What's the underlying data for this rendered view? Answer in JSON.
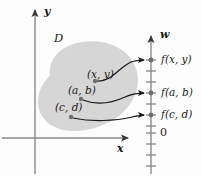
{
  "figure": {
    "domain_label": "D",
    "axes": {
      "x_label": "x",
      "y_label": "y",
      "w_label": "w",
      "origin_label": "0"
    },
    "colors": {
      "blob_fill": "#d6d6d6",
      "axis_stroke": "#8a8a8a",
      "arrow_stroke": "#1a1a1a",
      "dot_fill": "#6e6e6e",
      "text": "#1a1a1a",
      "background": "#fdfdfd"
    },
    "points": [
      {
        "id": "point-xy",
        "label": "(x, y)",
        "label_x": 87,
        "label_y": 74,
        "dot_x": 95,
        "dot_y": 81
      },
      {
        "id": "point-ab",
        "label": "(a, b)",
        "label_x": 68,
        "label_y": 90,
        "dot_x": 81,
        "dot_y": 99
      },
      {
        "id": "point-cd",
        "label": "(c, d)",
        "label_x": 55,
        "label_y": 107,
        "dot_x": 71,
        "dot_y": 117
      }
    ],
    "values": [
      {
        "id": "value-fxy",
        "label": "f(x, y)",
        "label_x": 162,
        "label_y": 55,
        "tick_y": 60
      },
      {
        "id": "value-fab",
        "label": "f(a, b)",
        "label_x": 162,
        "label_y": 88,
        "tick_y": 93
      },
      {
        "id": "value-fcd",
        "label": "f(c, d)",
        "label_x": 162,
        "label_y": 110,
        "tick_y": 115
      }
    ],
    "w_axis": {
      "x": 151,
      "top": 34,
      "bottom": 174,
      "zero_y": 133,
      "tick_half_width": 5,
      "ticks_y": [
        60,
        71,
        82,
        93,
        104,
        115,
        126,
        133,
        144,
        155,
        166
      ]
    },
    "xy_axes": {
      "y_axis_x": 35,
      "y_axis_top": 8,
      "y_axis_bottom": 174,
      "x_axis_y": 138,
      "x_axis_left": 2,
      "x_axis_right": 131,
      "x_label_x": 117,
      "x_label_y": 145,
      "y_label_x": 44,
      "y_label_y": 8,
      "w_label_x": 160,
      "w_label_y": 32,
      "zero_label_x": 159,
      "zero_label_y": 127
    },
    "blob": {
      "fill": "#d6d6d6",
      "path": "M 50 75 C 48 58, 62 45, 82 42 C 103 39, 124 46, 133 62 C 142 78, 138 95, 127 108 C 118 119, 103 127, 86 130 C 70 133, 54 130, 45 120 C 36 110, 36 96, 42 86 C 45 81, 48 78, 50 75 Z"
    },
    "arrows": [
      {
        "id": "arrow-xy",
        "from_label": "(x, y)",
        "to_label": "f(x, y)",
        "path": "M 97 81 C 112 82, 118 68, 131 62 C 136 60, 140 60, 144 60"
      },
      {
        "id": "arrow-ab",
        "from_label": "(a, b)",
        "to_label": "f(a, b)",
        "path": "M 83 100 C 98 106, 112 103, 125 97 C 131 94, 138 93, 144 93"
      },
      {
        "id": "arrow-cd",
        "from_label": "(c, d)",
        "to_label": "f(c, d)",
        "path": "M 73 118 C 92 122, 115 121, 132 117 C 137 116, 141 115, 144 115"
      }
    ]
  }
}
